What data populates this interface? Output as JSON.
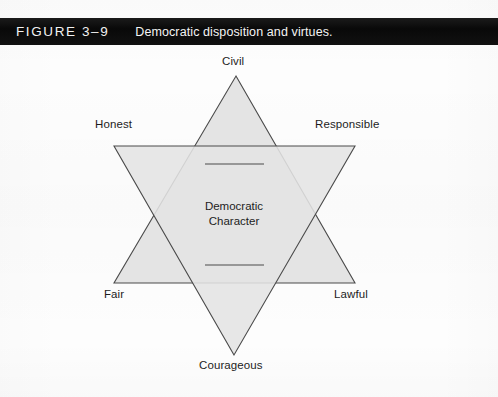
{
  "figure": {
    "number": "FIGURE 3–9",
    "title": "Democratic disposition and virtues."
  },
  "diagram": {
    "type": "hexagram-star",
    "center_label_line1": "Democratic",
    "center_label_line2": "Character",
    "fill_color": "#e4e4e4",
    "stroke_color": "#4a4a4a",
    "background_color": "#ffffff",
    "caption_bar_color": "#0d0d0d",
    "caption_text_color": "#f2f2f2",
    "points": [
      {
        "key": "civil",
        "label": "Civil",
        "position": "top"
      },
      {
        "key": "responsible",
        "label": "Responsible",
        "position": "upper-right"
      },
      {
        "key": "lawful",
        "label": "Lawful",
        "position": "lower-right"
      },
      {
        "key": "courageous",
        "label": "Courageous",
        "position": "bottom"
      },
      {
        "key": "fair",
        "label": "Fair",
        "position": "lower-left"
      },
      {
        "key": "honest",
        "label": "Honest",
        "position": "upper-left"
      }
    ]
  }
}
